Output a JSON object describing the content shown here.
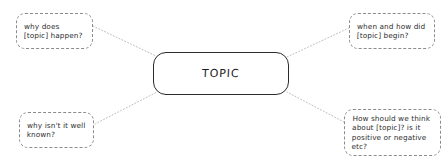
{
  "diagram": {
    "type": "mind-map",
    "background_color": "#ffffff",
    "center": {
      "id": "center",
      "label": "TOPIC",
      "border_color": "#2b2b2b",
      "border_style": "solid",
      "shape": "rounded-rectangle"
    },
    "branches": [
      {
        "id": "top-left",
        "label": "why does\n[topic] happen?",
        "position": "top-left",
        "border_color": "#8b8b8b",
        "border_style": "dashed",
        "shape": "rounded-rectangle"
      },
      {
        "id": "top-right",
        "label": "when and how did\n[topic] begin?",
        "position": "top-right",
        "border_color": "#8b8b8b",
        "border_style": "dashed",
        "shape": "rounded-rectangle"
      },
      {
        "id": "bottom-left",
        "label": "why isn't it well\nknown?",
        "position": "bottom-left",
        "border_color": "#8b8b8b",
        "border_style": "dashed",
        "shape": "rounded-rectangle"
      },
      {
        "id": "bottom-right",
        "label": "How should we think\nabout [topic]? is it\npositive or negative\netc?",
        "position": "bottom-right",
        "border_color": "#8b8b8b",
        "border_style": "dashed",
        "shape": "rounded-rectangle"
      }
    ],
    "connectors": {
      "style": "dotted",
      "color": "#bdbdbd",
      "links": [
        {
          "from": "top-left",
          "to": "center"
        },
        {
          "from": "top-right",
          "to": "center"
        },
        {
          "from": "bottom-left",
          "to": "center"
        },
        {
          "from": "bottom-right",
          "to": "center"
        }
      ]
    }
  }
}
